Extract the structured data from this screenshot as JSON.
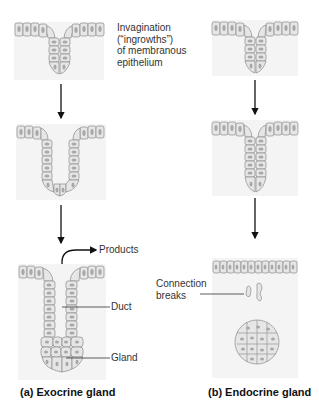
{
  "figure": {
    "type": "diagram",
    "panels": [
      {
        "id": "a",
        "caption": "(a) Exocrine gland",
        "stages": [
          "invagination",
          "deepening ingrowth",
          "duct and gland formed"
        ],
        "labels": {
          "products": "Products",
          "duct": "Duct",
          "gland": "Gland"
        }
      },
      {
        "id": "b",
        "caption": "(b) Endocrine gland",
        "stages": [
          "invagination",
          "deepening ingrowth",
          "connection breaks, isolated gland"
        ],
        "labels": {
          "connection_breaks_line1": "Connection",
          "connection_breaks_line2": "breaks"
        }
      }
    ],
    "invagination_note": {
      "line1": "Invagination",
      "line2": "(“ingrowths”)",
      "line3": "of membranous",
      "line4": "epithelium"
    },
    "colors": {
      "cell_fill": "#e6e6e6",
      "cell_stroke": "#8a8a8a",
      "nucleus": "#a8a8a8",
      "background_tissue": "#f4f4f4",
      "arrow": "#111111",
      "leader_line": "#333333"
    }
  }
}
